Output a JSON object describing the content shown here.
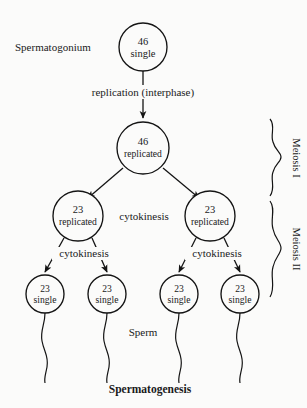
{
  "figure": {
    "title": "Spermatogenesis",
    "sperm_label": "Sperm",
    "source_label": "Spermatogonium"
  },
  "stages": {
    "replication_label": "replication (interphase)",
    "cytokinesis_meiosis1": "cytokinesis",
    "cytokinesis_left": "cytokinesis",
    "cytokinesis_right": "cytokinesis"
  },
  "brackets": [
    {
      "name": "meiosis-i",
      "label": "Meiosis I"
    },
    {
      "name": "meiosis-ii",
      "label": "Meiosis II"
    }
  ],
  "cells": {
    "spermatogonium": {
      "count": "46",
      "state": "single"
    },
    "primary_spermatocyte": {
      "count": "46",
      "state": "replicated"
    },
    "secondary_spermatocyte_left": {
      "count": "23",
      "state": "replicated"
    },
    "secondary_spermatocyte_right": {
      "count": "23",
      "state": "replicated"
    },
    "spermatid_1": {
      "count": "23",
      "state": "single"
    },
    "spermatid_2": {
      "count": "23",
      "state": "single"
    },
    "spermatid_3": {
      "count": "23",
      "state": "single"
    },
    "spermatid_4": {
      "count": "23",
      "state": "single"
    }
  },
  "colors": {
    "background": "#fbfbfa",
    "ink": "#141414",
    "text": "#1a1a1a"
  }
}
